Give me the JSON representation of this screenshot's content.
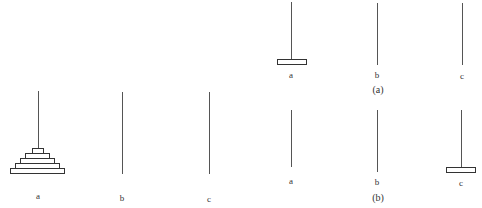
{
  "figures": {
    "initial": {
      "pegs": [
        {
          "label": "a",
          "disc_count": 5
        },
        {
          "label": "b",
          "disc_count": 0
        },
        {
          "label": "c",
          "disc_count": 0
        }
      ]
    },
    "subfigure_a": {
      "caption": "(a)",
      "pegs": [
        {
          "label": "a",
          "disc_count": 1
        },
        {
          "label": "b",
          "disc_count": 0
        },
        {
          "label": "c",
          "disc_count": 0
        }
      ]
    },
    "subfigure_b": {
      "caption": "(b)",
      "pegs": [
        {
          "label": "a",
          "disc_count": 0
        },
        {
          "label": "b",
          "disc_count": 0
        },
        {
          "label": "c",
          "disc_count": 1
        }
      ]
    }
  },
  "colors": {
    "line": "#555555",
    "disc_border": "#333333",
    "background": "#ffffff"
  }
}
